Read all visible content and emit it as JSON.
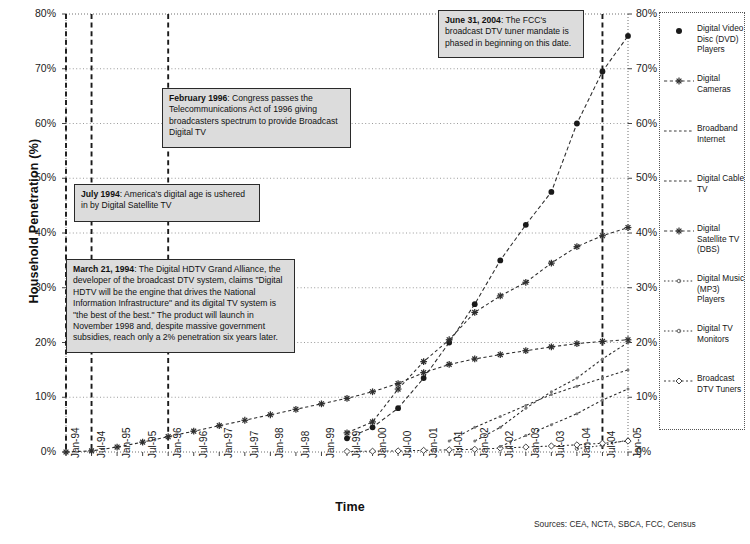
{
  "chart_data": {
    "type": "line",
    "title": "",
    "xlabel": "Time",
    "ylabel": "Household Penetration (%)",
    "ylim": [
      0,
      80
    ],
    "ytick_labels": [
      "0%",
      "10%",
      "20%",
      "30%",
      "40%",
      "50%",
      "60%",
      "70%",
      "80%"
    ],
    "ytick_values": [
      0,
      10,
      20,
      30,
      40,
      50,
      60,
      70,
      80
    ],
    "grid": true,
    "legend_position": "right",
    "dual_y_axis": true,
    "categories": [
      "Jan-94",
      "Jul-94",
      "Jan-95",
      "Jul-95",
      "Jan-96",
      "Jul-96",
      "Jan-97",
      "Jul-97",
      "Jan-98",
      "Jul-98",
      "Jan-99",
      "Jul-99",
      "Jan-00",
      "Jul-00",
      "Jan-01",
      "Jul-01",
      "Jan-02",
      "Jul-02",
      "Jan-03",
      "Jul-03",
      "Jan-04",
      "Jul-04",
      "Jan-05"
    ],
    "series": [
      {
        "name": "Digital Video Disc (DVD) Players",
        "marker": "filled-diamond",
        "values": [
          null,
          null,
          null,
          null,
          null,
          null,
          null,
          null,
          null,
          null,
          null,
          2.5,
          4.5,
          8.0,
          13.5,
          20.0,
          27.0,
          35.0,
          41.5,
          47.5,
          60.0,
          69.5,
          76.0
        ]
      },
      {
        "name": "Digital Cameras",
        "marker": "asterisk",
        "values": [
          null,
          null,
          null,
          null,
          null,
          null,
          null,
          null,
          null,
          null,
          null,
          3.5,
          5.5,
          11.5,
          16.5,
          20.5,
          25.5,
          28.5,
          31.0,
          34.5,
          37.5,
          39.5,
          41.0
        ]
      },
      {
        "name": "Broadband Internet",
        "marker": "plain",
        "values": [
          null,
          null,
          null,
          null,
          null,
          null,
          null,
          null,
          null,
          null,
          null,
          null,
          null,
          null,
          null,
          null,
          2.0,
          4.5,
          8.0,
          11.0,
          13.5,
          17.0,
          20.0
        ]
      },
      {
        "name": "Digital Cable TV",
        "marker": "plain",
        "values": [
          null,
          null,
          null,
          null,
          null,
          null,
          null,
          null,
          null,
          null,
          null,
          null,
          null,
          null,
          null,
          2.0,
          4.5,
          6.5,
          8.5,
          10.5,
          12.0,
          13.5,
          15.0
        ]
      },
      {
        "name": "Digital Satellite TV (DBS)",
        "marker": "asterisk",
        "values": [
          0.0,
          0.2,
          0.9,
          1.8,
          2.8,
          3.8,
          4.8,
          5.8,
          6.8,
          7.8,
          8.8,
          9.8,
          11.0,
          12.5,
          14.5,
          16.0,
          17.0,
          17.8,
          18.5,
          19.2,
          19.8,
          20.2,
          20.5
        ]
      },
      {
        "name": "Digital Music (MP3) Players",
        "marker": "dotted",
        "values": [
          null,
          null,
          null,
          null,
          null,
          null,
          null,
          null,
          null,
          null,
          null,
          null,
          null,
          null,
          null,
          null,
          null,
          null,
          null,
          null,
          0.6,
          1.2,
          2.2
        ]
      },
      {
        "name": "Digital TV Monitors",
        "marker": "dotted",
        "values": [
          null,
          null,
          null,
          null,
          null,
          null,
          null,
          null,
          null,
          null,
          null,
          null,
          null,
          null,
          null,
          null,
          null,
          null,
          null,
          null,
          null,
          null,
          null
        ]
      },
      {
        "name": "Broadcast DTV Tuners",
        "marker": "open-diamond",
        "values": [
          null,
          null,
          null,
          null,
          null,
          null,
          null,
          null,
          null,
          null,
          null,
          0.1,
          0.15,
          0.2,
          0.3,
          0.4,
          0.5,
          0.7,
          0.9,
          1.1,
          1.3,
          1.6,
          2.0
        ]
      }
    ],
    "secondary_series": [
      {
        "name": "Digital Cable TV (lower band)",
        "values": [
          null,
          null,
          null,
          null,
          null,
          null,
          null,
          null,
          null,
          null,
          null,
          null,
          null,
          null,
          null,
          null,
          null,
          1.0,
          3.0,
          5.0,
          7.0,
          9.5,
          11.5
        ]
      }
    ],
    "event_lines": [
      {
        "label": "March 21, 1994",
        "category": "Jan-94"
      },
      {
        "label": "July 1994",
        "category": "Jul-94"
      },
      {
        "label": "February 1996",
        "category": "Jan-96"
      },
      {
        "label": "June 31, 2004",
        "category": "Jul-04"
      }
    ],
    "annotations": [
      {
        "id": "june-2004",
        "date_label": "June 31, 2004",
        "text": ": The FCC's broadcast DTV tuner mandate is phased in beginning on this date."
      },
      {
        "id": "february-1996",
        "date_label": "February 1996",
        "text": ": Congress passes the Telecommunications Act of 1996 giving broadcasters spectrum to provide Broadcast Digital TV"
      },
      {
        "id": "july-1994",
        "date_label": "July 1994",
        "text": ": America's digital age is ushered in by Digital Satellite TV"
      },
      {
        "id": "march-1994",
        "date_label": "March 21, 1994",
        "text": ": The Digital HDTV Grand Alliance, the developer of the broadcast DTV system, claims \"Digital HDTV will be the engine that drives the National Information Infrastructure\" and its digital TV system is \"the best of the best.\"  The product will launch in November 1998 and, despite massive government subsidies, reach only a 2% penetration six years later."
      }
    ]
  },
  "legend": {
    "items": [
      {
        "label": "Digital Video Disc (DVD) Players",
        "key": "filled-diamond"
      },
      {
        "label": "Digital Cameras",
        "key": "asterisk"
      },
      {
        "label": "Broadband Internet",
        "key": "plain"
      },
      {
        "label": "Digital Cable TV",
        "key": "plain"
      },
      {
        "label": "Digital Satellite TV (DBS)",
        "key": "asterisk"
      },
      {
        "label": "Digital Music (MP3) Players",
        "key": "dotted"
      },
      {
        "label": "Digital TV Monitors",
        "key": "dotted"
      },
      {
        "label": "Broadcast DTV Tuners",
        "key": "open-diamond"
      }
    ]
  },
  "footer": {
    "sources": "Sources: CEA, NCTA, SBCA, FCC, Census"
  },
  "colors": {
    "ink": "#1a1a1a",
    "grid": "#9a9a9a",
    "callout_fill": "#dcdcdc",
    "callout_border": "#2a2a2a"
  }
}
